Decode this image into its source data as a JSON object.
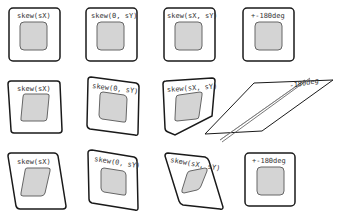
{
  "colors": {
    "outer_stroke": "#1a1a1a",
    "inner_fill": "#d4d4d4",
    "inner_stroke": "#666666",
    "background": "#ffffff"
  },
  "rows": [
    {
      "cells": [
        {
          "label": "skew(sX)"
        },
        {
          "label": "skew(0, sY)"
        },
        {
          "label": "skew(sX, sY)"
        },
        {
          "label": "+-180deg"
        }
      ]
    },
    {
      "cells": [
        {
          "label": "skew(sX)"
        },
        {
          "label": "skew(0, sY)"
        },
        {
          "label": "skew(sX, sY)"
        },
        {
          "label": "-180deg"
        }
      ]
    },
    {
      "cells": [
        {
          "label": "skew(sX)"
        },
        {
          "label": "skew(0, sY)"
        },
        {
          "label": "skew(sX, sY)"
        },
        {
          "label": "+-180deg"
        }
      ]
    }
  ]
}
